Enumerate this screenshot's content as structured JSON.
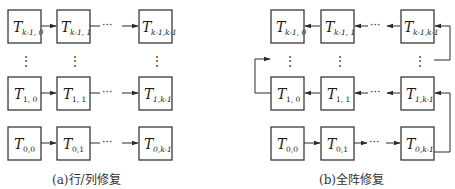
{
  "figure": {
    "stroke_color": "#2a2a2a",
    "box_fill": "#ffffff",
    "panels": [
      {
        "id": "a",
        "caption": "(a)行/列修复",
        "cells": {
          "row_top": [
            {
              "main": "T",
              "sub": "k-1, 0"
            },
            {
              "main": "T",
              "sub": "k-1, 1"
            },
            {
              "main": "T",
              "sub": "k-1,k-1"
            }
          ],
          "row_middle": [
            {
              "main": "T",
              "sub": "1, 0"
            },
            {
              "main": "T",
              "sub": "1, 1"
            },
            {
              "main": "T",
              "sub": "1,k-1"
            }
          ],
          "row_bottom": [
            {
              "main": "T",
              "sub": "0,0"
            },
            {
              "main": "T",
              "sub": "0,1"
            },
            {
              "main": "T",
              "sub": "0,k-1"
            }
          ]
        },
        "flow": "left-to-right per row"
      },
      {
        "id": "b",
        "caption": "(b)全阵修复",
        "cells": {
          "row_top": [
            {
              "main": "T",
              "sub": "k-1, 0"
            },
            {
              "main": "T",
              "sub": "k-1, 1"
            },
            {
              "main": "T",
              "sub": "k-1,k-1"
            }
          ],
          "row_middle": [
            {
              "main": "T",
              "sub": "1, 0"
            },
            {
              "main": "T",
              "sub": "1, 1"
            },
            {
              "main": "T",
              "sub": "1,k-1"
            }
          ],
          "row_bottom": [
            {
              "main": "T",
              "sub": "0,0"
            },
            {
              "main": "T",
              "sub": "0,1"
            },
            {
              "main": "T",
              "sub": "0,k-1"
            }
          ]
        },
        "flow": "serpentine: row 0 left-to-right, row 1 right-to-left, ..., row k-1 right-to-left"
      }
    ],
    "ellipsis_h": "···",
    "ellipsis_v": "⋮"
  }
}
